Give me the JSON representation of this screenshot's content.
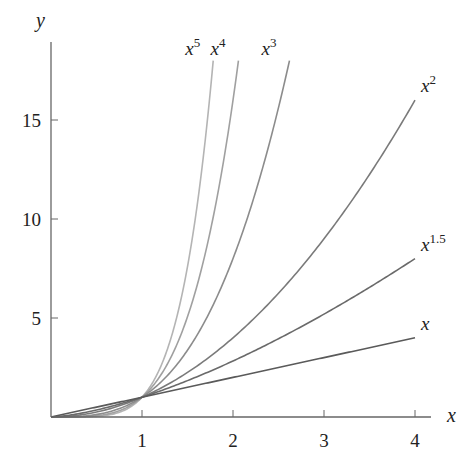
{
  "chart_data": {
    "type": "line",
    "title": "",
    "xlabel": "x",
    "ylabel": "y",
    "xlim": [
      0,
      4.2
    ],
    "ylim": [
      0,
      18
    ],
    "x_ticks": [
      1,
      2,
      3,
      4
    ],
    "y_ticks": [
      5,
      10,
      15
    ],
    "grid": false,
    "legend": "inline labels at curve ends",
    "series": [
      {
        "name": "x",
        "label_base": "x",
        "label_exp": "",
        "exponent": 1,
        "color": "#5a5a5a",
        "x": [
          0,
          1,
          2,
          3,
          4
        ],
        "values": [
          0,
          1,
          2,
          3,
          4
        ]
      },
      {
        "name": "x^1.5",
        "label_base": "x",
        "label_exp": "1.5",
        "exponent": 1.5,
        "color": "#6a6a6a",
        "x": [
          0,
          1,
          2,
          3,
          4
        ],
        "values": [
          0,
          1,
          2.83,
          5.2,
          8
        ]
      },
      {
        "name": "x^2",
        "label_base": "x",
        "label_exp": "2",
        "exponent": 2,
        "color": "#7a7a7a",
        "x": [
          0,
          1,
          2,
          3,
          4
        ],
        "values": [
          0,
          1,
          4,
          9,
          16
        ]
      },
      {
        "name": "x^3",
        "label_base": "x",
        "label_exp": "3",
        "exponent": 3,
        "color": "#8c8c8c",
        "x": [
          0,
          1,
          2,
          2.62
        ],
        "values": [
          0,
          1,
          8,
          18
        ]
      },
      {
        "name": "x^4",
        "label_base": "x",
        "label_exp": "4",
        "exponent": 4,
        "color": "#a0a0a0",
        "x": [
          0,
          1,
          1.5,
          2.06
        ],
        "values": [
          0,
          1,
          5.06,
          18
        ]
      },
      {
        "name": "x^5",
        "label_base": "x",
        "label_exp": "5",
        "exponent": 5,
        "color": "#b4b4b4",
        "x": [
          0,
          1,
          1.5,
          1.78
        ],
        "values": [
          0,
          1,
          7.59,
          18
        ]
      }
    ]
  },
  "layout": {
    "origin_px": [
      51,
      417
    ],
    "x_px_per_unit": 91,
    "y_px_per_unit": 19.8,
    "y_max_draw": 18,
    "x_max_draw": 4
  }
}
